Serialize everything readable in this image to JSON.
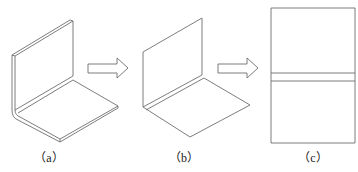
{
  "figure": {
    "panels": [
      {
        "id": "a",
        "label": "（a）",
        "description": "Sheet metal L-bracket with rounded bend (original part)"
      },
      {
        "id": "b",
        "label": "（b）",
        "description": "L-bracket with sharp bend (simplified model)"
      },
      {
        "id": "c",
        "label": "（c）",
        "description": "Flattened sheet with bend region band"
      }
    ],
    "arrows": [
      {
        "from": "a",
        "to": "b",
        "style": "hollow-right-arrow"
      },
      {
        "from": "b",
        "to": "c",
        "style": "hollow-right-arrow"
      }
    ]
  },
  "colors": {
    "line": "#6e6e6e",
    "background": "#ffffff",
    "label": "#222222"
  }
}
